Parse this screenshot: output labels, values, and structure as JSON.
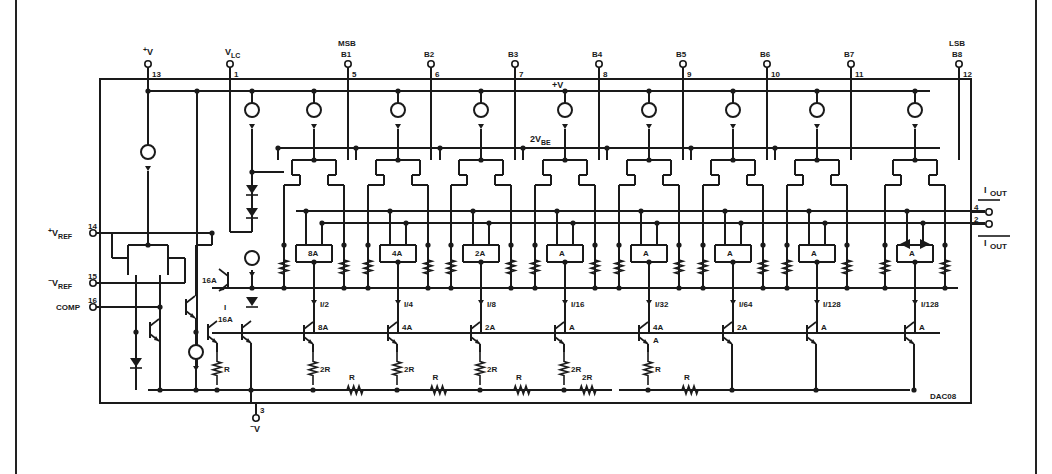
{
  "diagram": {
    "part_number": "DAC08",
    "top_pins": [
      {
        "label": "V+",
        "sup": "+",
        "base": "V",
        "pin": "13",
        "x": 148
      },
      {
        "label": "VLC",
        "base": "V",
        "sub": "LC",
        "pin": "1",
        "x": 230
      },
      {
        "label": "B1",
        "top_label": "MSB",
        "pin": "5",
        "x": 348
      },
      {
        "label": "B2",
        "pin": "6",
        "x": 431
      },
      {
        "label": "B3",
        "pin": "7",
        "x": 515
      },
      {
        "label": "B4",
        "pin": "8",
        "x": 599
      },
      {
        "label": "B5",
        "pin": "9",
        "x": 683
      },
      {
        "label": "B6",
        "pin": "10",
        "x": 767
      },
      {
        "label": "B7",
        "pin": "11",
        "x": 851
      },
      {
        "label": "B8",
        "top_label": "LSB",
        "pin": "12",
        "x": 959
      }
    ],
    "left_pins": [
      {
        "label": "+VREF",
        "sup": "+",
        "base": "V",
        "sub": "REF",
        "pin": "14",
        "y": 233
      },
      {
        "label": "-VREF",
        "sup": "−",
        "base": "V",
        "sub": "REF",
        "pin": "15",
        "y": 283
      },
      {
        "label": "COMP",
        "pin": "16",
        "y": 307
      }
    ],
    "right_pins": [
      {
        "label": "IOUT",
        "pin": "4",
        "y": 212
      },
      {
        "label": "IOUT (complement)",
        "pin": "2",
        "y": 224
      }
    ],
    "bottom_pin": {
      "label": "-V",
      "sup": "−",
      "base": "V",
      "pin": "3",
      "x": 256
    },
    "internal_labels": {
      "supply": "+V",
      "bias": "2V",
      "bias_sub": "BE",
      "ref_transistor_upper": "16A",
      "ref_current": "I",
      "ref_transistor_lower": "16A",
      "ref_resistor": "R"
    },
    "switch_stages": [
      {
        "area": "8A",
        "current": "I/2",
        "ladder_transistor": "8A",
        "ladder_resistor": "2R"
      },
      {
        "area": "4A",
        "current": "I/4",
        "ladder_transistor": "4A",
        "ladder_resistor": "2R"
      },
      {
        "area": "2A",
        "current": "I/8",
        "ladder_transistor": "2A",
        "ladder_resistor": "2R"
      },
      {
        "area": "A",
        "current": "I/16",
        "ladder_transistor": "A",
        "ladder_resistor": "2R"
      },
      {
        "area": "A",
        "current": "I/32",
        "ladder_transistor": "4A",
        "ladder_transistor_emitter": "A",
        "ladder_resistor": "R"
      },
      {
        "area": "A",
        "current": "I/64",
        "ladder_transistor": "2A"
      },
      {
        "area": "A",
        "current": "I/128",
        "ladder_transistor": "A"
      },
      {
        "area": "A",
        "current": "I/128",
        "ladder_transistor": "A"
      }
    ],
    "ladder_series_resistors": [
      "R",
      "R",
      "R",
      "2R",
      "R"
    ],
    "output_labels": {
      "iout": "I",
      "iout_sub": "OUT",
      "iout_bar": "I",
      "iout_bar_sub": "OUT"
    }
  }
}
